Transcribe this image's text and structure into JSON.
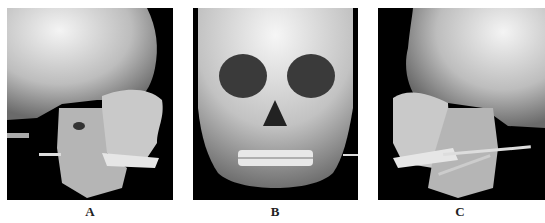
{
  "figure": {
    "panels": [
      {
        "label": "A",
        "view": "right lateral 3D CT reconstruction of skull"
      },
      {
        "label": "B",
        "view": "frontal 3D CT reconstruction of skull"
      },
      {
        "label": "C",
        "view": "left lateral 3D CT reconstruction of skull"
      }
    ]
  },
  "colors": {
    "background": "#000000",
    "bone": "#d8d8d8",
    "page": "#ffffff"
  }
}
